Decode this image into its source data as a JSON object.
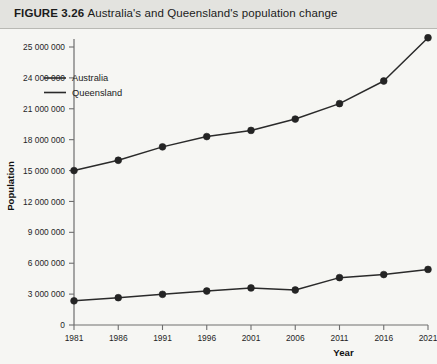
{
  "figure": {
    "label": "FIGURE 3.26",
    "caption": "Australia's and Queensland's population change",
    "full_title": "FIGURE 3.26 Australia's and Queensland's population change"
  },
  "colors": {
    "page_background": "#f2f2ef",
    "title_bar_background": "#e3e3df",
    "plot_background": "#f6f6f3",
    "axis": "#6e6e6e",
    "series_australia": "#2a2a2a",
    "series_queensland": "#2a2a2a",
    "text": "#1b1b1b"
  },
  "chart_data": {
    "type": "line",
    "title": "Australia's and Queensland's population change",
    "xlabel": "Year",
    "ylabel": "Population",
    "categories": [
      1981,
      1986,
      1991,
      1996,
      2001,
      2006,
      2011,
      2016,
      2021
    ],
    "x_tick_labels": [
      "1981",
      "1986",
      "1991",
      "1996",
      "2001",
      "2006",
      "2011",
      "2016",
      "2021"
    ],
    "y_tick_values": [
      0,
      3000000,
      6000000,
      9000000,
      12000000,
      15000000,
      18000000,
      21000000,
      24000000,
      25000000
    ],
    "y_tick_labels": [
      "0",
      "3 000 000",
      "6 000 000",
      "9 000 000",
      "12 000 000",
      "15 000 000",
      "18 000 000",
      "21 000 000",
      "24 000 000",
      "25 000 000"
    ],
    "ylim": [
      0,
      25000000
    ],
    "grid": false,
    "legend_position": "upper-left-inside",
    "series": [
      {
        "name": "Australia",
        "marker": "circle",
        "values": [
          15000000,
          16000000,
          17300000,
          18300000,
          18900000,
          20000000,
          21500000,
          23700000,
          25300000
        ]
      },
      {
        "name": "Queensland",
        "marker": "circle",
        "values": [
          2350000,
          2650000,
          2980000,
          3300000,
          3600000,
          3400000,
          4600000,
          4900000,
          5400000
        ]
      }
    ]
  },
  "legend": {
    "items": [
      {
        "label": "Australia"
      },
      {
        "label": "Queensland"
      }
    ]
  }
}
